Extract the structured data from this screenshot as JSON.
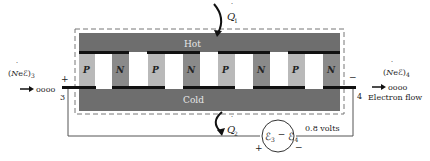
{
  "diagram": {
    "hot_label": "Hot",
    "cold_label": "Cold",
    "q1": {
      "symbol": "Q",
      "subscript": "1"
    },
    "q2": {
      "symbol": "Q",
      "subscript": "2"
    },
    "left_flux": {
      "text": "(NeE)",
      "subscript": "3"
    },
    "right_flux": {
      "text": "(NeE)",
      "subscript": "4"
    },
    "terminal_left": {
      "number": "3",
      "sign": "+"
    },
    "terminal_right": {
      "number": "4",
      "sign": "−"
    },
    "electrons_left": "oooo",
    "electrons_right": "oooo",
    "electron_flow_label": "Electron flow",
    "voltage_label": "0.8 volts",
    "source": {
      "label": "E3 − E4",
      "plus": "+",
      "minus": "−"
    },
    "legs": [
      "P",
      "N",
      "P",
      "N",
      "P",
      "N",
      "P",
      "N"
    ],
    "colors": {
      "hot_slab": "#6e6e6e",
      "cold_slab": "#6e6e6e",
      "p_leg": "#b9b9b9",
      "n_leg": "#8a8a8a",
      "conductor": "#111111",
      "dashed_border": "#777777",
      "wire": "#555555"
    }
  }
}
